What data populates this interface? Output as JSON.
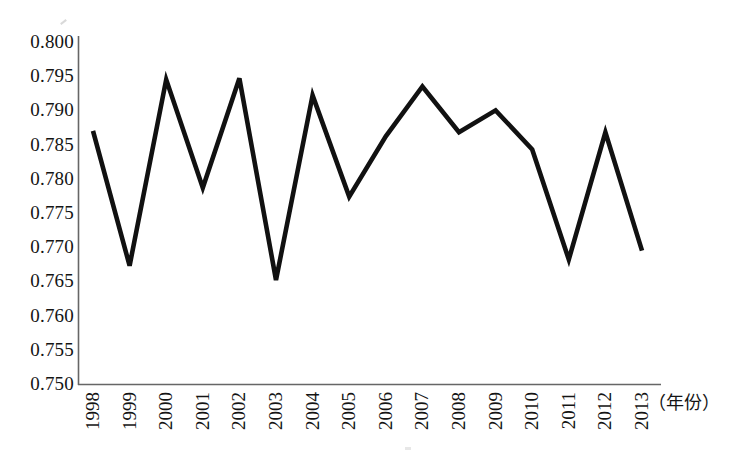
{
  "chart_data": {
    "type": "line",
    "title": "",
    "subtitle": "",
    "xlabel": "（年份）",
    "ylabel": "",
    "x": [
      1998,
      1999,
      2000,
      2001,
      2002,
      2003,
      2004,
      2005,
      2006,
      2007,
      2008,
      2009,
      2010,
      2011,
      2012,
      2013
    ],
    "categories": [
      "1998",
      "1999",
      "2000",
      "2001",
      "2002",
      "2003",
      "2004",
      "2005",
      "2006",
      "2007",
      "2008",
      "2009",
      "2010",
      "2011",
      "2012",
      "2013"
    ],
    "values": [
      0.787,
      0.7673,
      0.7945,
      0.7787,
      0.7947,
      0.7652,
      0.7922,
      0.7774,
      0.7862,
      0.7935,
      0.7868,
      0.79,
      0.7843,
      0.7682,
      0.7868,
      0.7695
    ],
    "series": [
      {
        "name": "",
        "values": [
          0.787,
          0.7673,
          0.7945,
          0.7787,
          0.7947,
          0.7652,
          0.7922,
          0.7774,
          0.7862,
          0.7935,
          0.7868,
          0.79,
          0.7843,
          0.7682,
          0.7868,
          0.7695
        ]
      }
    ],
    "ylim": [
      0.75,
      0.8
    ],
    "yticks": [
      0.75,
      0.755,
      0.76,
      0.765,
      0.77,
      0.775,
      0.78,
      0.785,
      0.79,
      0.795,
      0.8
    ],
    "ytick_labels": [
      "0.750",
      "0.755",
      "0.760",
      "0.765",
      "0.770",
      "0.775",
      "0.780",
      "0.785",
      "0.790",
      "0.795",
      "0.800"
    ],
    "grid": false,
    "legend": null,
    "legend_position": "none",
    "line_color": "#111111",
    "axis_color": "#555555",
    "background_color": "#ffffff",
    "markers": false
  },
  "axes": {
    "y_tick_labels": [
      "0.800",
      "0.795",
      "0.790",
      "0.785",
      "0.780",
      "0.775",
      "0.770",
      "0.765",
      "0.760",
      "0.755",
      "0.750"
    ],
    "x_tick_labels": [
      "1998",
      "1999",
      "2000",
      "2001",
      "2002",
      "2003",
      "2004",
      "2005",
      "2006",
      "2007",
      "2008",
      "2009",
      "2010",
      "2011",
      "2012",
      "2013"
    ],
    "x_axis_title": "（年份）"
  }
}
